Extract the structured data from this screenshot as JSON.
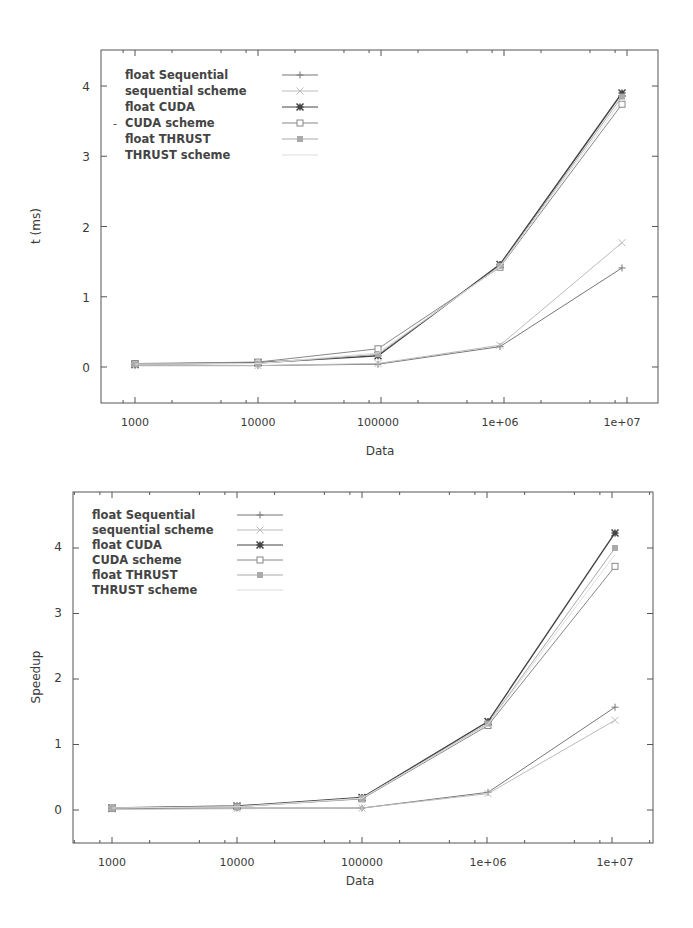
{
  "chart_data": [
    {
      "type": "line",
      "title": "",
      "xlabel": "Data",
      "ylabel": "t (ms)",
      "x_scale": "log",
      "categories": [
        "1000",
        "10000",
        "100000",
        "1e+06",
        "1e+07"
      ],
      "x": [
        1000,
        10000,
        100000,
        1000000,
        10000000
      ],
      "yticks": [
        "0",
        "1",
        "2",
        "3",
        "4"
      ],
      "ylim": [
        -0.5,
        4.5
      ],
      "grid": false,
      "legend_position": "top-left",
      "series": [
        {
          "name": "float   Sequential",
          "marker": "plus",
          "color": "#777777",
          "values": [
            0.02,
            0.02,
            0.04,
            0.29,
            1.41
          ]
        },
        {
          "name": "sequential scheme",
          "marker": "cross",
          "color": "#bbbbbb",
          "values": [
            0.02,
            0.02,
            0.05,
            0.31,
            1.77
          ]
        },
        {
          "name": "float CUDA",
          "marker": "star",
          "color": "#444444",
          "values": [
            0.04,
            0.06,
            0.16,
            1.46,
            3.9
          ]
        },
        {
          "name": "CUDA scheme",
          "marker": "square",
          "color": "#888888",
          "values": [
            0.05,
            0.07,
            0.26,
            1.42,
            3.74
          ]
        },
        {
          "name": "float THRUST",
          "marker": "filled-square",
          "color": "#aaaaaa",
          "values": [
            0.04,
            0.05,
            0.18,
            1.44,
            3.85
          ]
        },
        {
          "name": "THRUST scheme",
          "marker": "none",
          "color": "#dddddd",
          "values": [
            0.04,
            0.05,
            0.2,
            1.43,
            3.8
          ]
        }
      ]
    },
    {
      "type": "line",
      "title": "",
      "xlabel": "Data",
      "ylabel": "Speedup",
      "x_scale": "log",
      "categories": [
        "1000",
        "10000",
        "100000",
        "1e+06",
        "1e+07"
      ],
      "x": [
        1000,
        10000,
        100000,
        1000000,
        10000000
      ],
      "yticks": [
        "0",
        "1",
        "2",
        "3",
        "4"
      ],
      "ylim": [
        -0.5,
        4.5
      ],
      "grid": false,
      "legend_position": "top-left",
      "series": [
        {
          "name": "float   Sequential",
          "marker": "plus",
          "color": "#777777",
          "values": [
            0.02,
            0.03,
            0.03,
            0.27,
            1.57
          ]
        },
        {
          "name": "sequential scheme",
          "marker": "cross",
          "color": "#bbbbbb",
          "values": [
            0.01,
            0.02,
            0.03,
            0.25,
            1.37
          ]
        },
        {
          "name": "float CUDA",
          "marker": "star",
          "color": "#444444",
          "values": [
            0.03,
            0.06,
            0.19,
            1.35,
            4.23
          ]
        },
        {
          "name": "CUDA scheme",
          "marker": "square",
          "color": "#888888",
          "values": [
            0.03,
            0.05,
            0.17,
            1.29,
            3.72
          ]
        },
        {
          "name": "float THRUST",
          "marker": "filled-square",
          "color": "#aaaaaa",
          "values": [
            0.03,
            0.05,
            0.18,
            1.32,
            4.0
          ]
        },
        {
          "name": "THRUST scheme",
          "marker": "none",
          "color": "#dddddd",
          "values": [
            0.03,
            0.05,
            0.18,
            1.31,
            3.9
          ]
        }
      ]
    }
  ],
  "charts": [
    {
      "ylabel": "t (ms)",
      "xlabel": "Data",
      "xticks": [
        "1000",
        "10000",
        "100000",
        "1e+06",
        "1e+07"
      ],
      "yticks": [
        "0",
        "1",
        "2",
        "3",
        "4"
      ],
      "legend": [
        "float   Sequential",
        "sequential scheme",
        "float CUDA",
        "CUDA scheme",
        "float THRUST",
        "THRUST scheme"
      ]
    },
    {
      "ylabel": "Speedup",
      "xlabel": "Data",
      "xticks": [
        "1000",
        "10000",
        "100000",
        "1e+06",
        "1e+07"
      ],
      "yticks": [
        "0",
        "1",
        "2",
        "3",
        "4"
      ],
      "legend": [
        "float   Sequential",
        "sequential scheme",
        "float CUDA",
        "CUDA scheme",
        "float THRUST",
        "THRUST scheme"
      ]
    }
  ]
}
